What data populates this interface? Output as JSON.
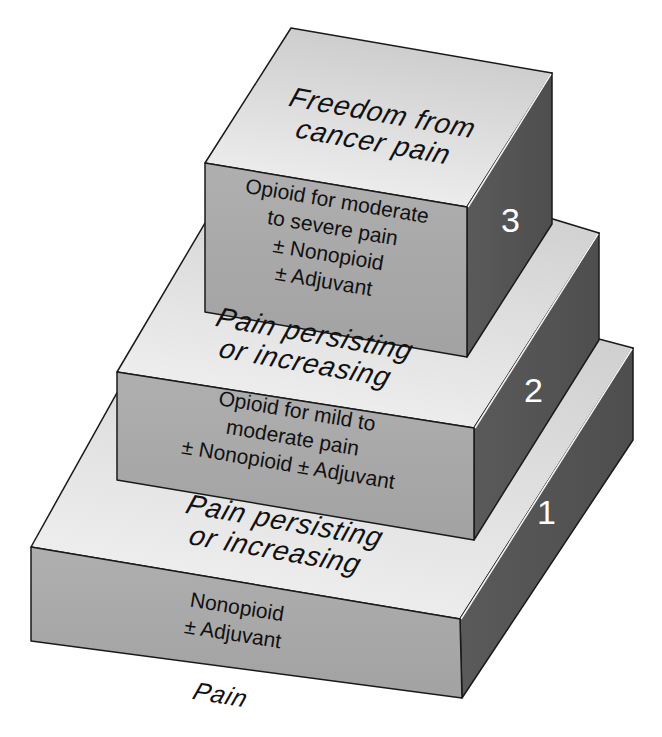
{
  "diagram": {
    "type": "stepped-pyramid",
    "colors": {
      "top_face_light": "#f2f2f2",
      "top_face_dark": "#cfcfcf",
      "front_face": "#a9a9a9",
      "right_face": "#555555",
      "outline": "#1a1a1a",
      "number_text": "#ffffff"
    },
    "base_label": "Pain",
    "steps": [
      {
        "number": "1",
        "top_label": [
          "Pain persisting",
          "or increasing"
        ],
        "front_text": [
          "Nonopioid",
          "± Adjuvant"
        ]
      },
      {
        "number": "2",
        "top_label": [
          "Pain persisting",
          "or increasing"
        ],
        "front_text": [
          "Opioid for mild to",
          "moderate pain",
          "± Nonopioid ± Adjuvant"
        ]
      },
      {
        "number": "3",
        "top_label": [
          "Freedom from",
          "cancer pain"
        ],
        "front_text": [
          "Opioid for moderate",
          "to severe pain",
          "± Nonopioid",
          "± Adjuvant"
        ]
      }
    ]
  }
}
